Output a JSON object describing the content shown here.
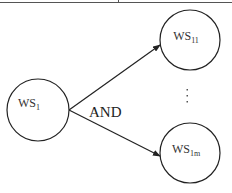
{
  "diagram": {
    "type": "tree",
    "colors": {
      "stroke": "#222222",
      "text": "#333333",
      "background": "#ffffff"
    },
    "nodes": [
      {
        "id": "ws1",
        "label": "WS",
        "subscript": "1",
        "cx": 38,
        "cy": 110,
        "r": 31
      },
      {
        "id": "ws11",
        "label": "WS",
        "subscript": "11",
        "cx": 190,
        "cy": 40,
        "r": 30
      },
      {
        "id": "ws1m",
        "label": "WS",
        "subscript": "1m",
        "cx": 190,
        "cy": 153,
        "r": 30
      }
    ],
    "edges": [
      {
        "from": "ws1",
        "to": "ws11"
      },
      {
        "from": "ws1",
        "to": "ws1m"
      }
    ],
    "relation_label": "AND",
    "ellipsis": "⋮"
  }
}
